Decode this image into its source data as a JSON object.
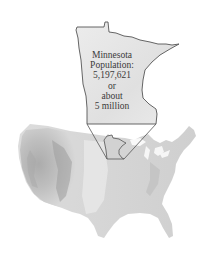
{
  "figure": {
    "callout": {
      "state_name": "Minnesota",
      "population_label": "Population:",
      "population_value": "5,197,621",
      "connector_word": "or",
      "approx_prefix": "about",
      "approx_value": "5 million"
    },
    "colors": {
      "state_fill": "#e4e4e4",
      "state_outline": "#555555",
      "map_light": "#e8e8e8",
      "map_mid": "#c9c9c9",
      "map_dark": "#9a9a9a"
    }
  }
}
